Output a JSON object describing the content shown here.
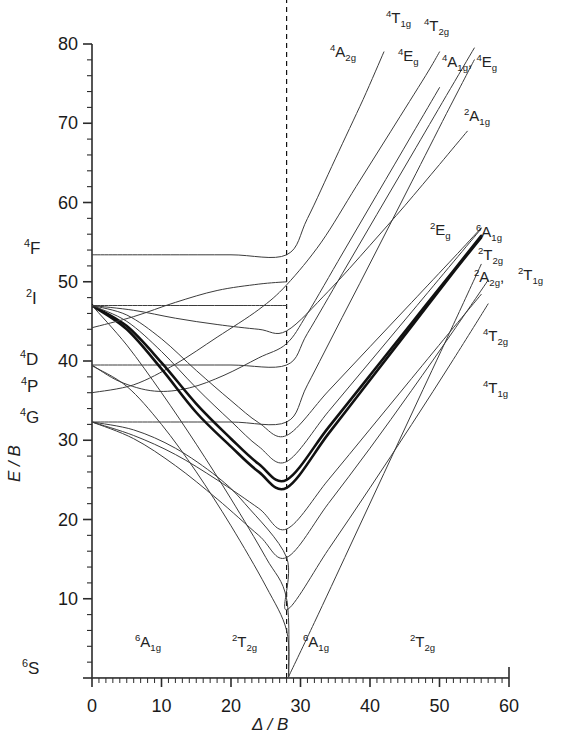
{
  "chart_data": {
    "type": "line",
    "title": "",
    "xlabel": "Δ / B",
    "ylabel": "E / B",
    "xlim": [
      0,
      60
    ],
    "ylim": [
      0,
      80
    ],
    "xticks": [
      0,
      10,
      20,
      30,
      40,
      50,
      60
    ],
    "yticks": [
      0,
      10,
      20,
      30,
      40,
      50,
      60,
      70,
      80
    ],
    "minor_tick_step": 2,
    "grid": false,
    "legend": "none",
    "crossover_x": 28,
    "crossover_line": "dashed vertical",
    "free_ion_terms": [
      {
        "label": "4F",
        "energy": 53.4
      },
      {
        "label": "2I",
        "energy": 47.0
      },
      {
        "label": "4D",
        "energy": 39.5
      },
      {
        "label": "4P",
        "energy": 36.0
      },
      {
        "label": "4G",
        "energy": 32.3
      },
      {
        "label": "6S",
        "energy": 0.0
      }
    ],
    "ground_state_labels": [
      {
        "label": "6A1g",
        "x": 9
      },
      {
        "label": "2T2g",
        "x": 24
      },
      {
        "label": "6A1g",
        "x": 32
      },
      {
        "label": "2T2g",
        "x": 48
      }
    ],
    "series": [
      {
        "name": "6A1g",
        "points": [
          [
            0,
            0
          ],
          [
            28,
            0
          ],
          [
            60,
            0
          ]
        ]
      },
      {
        "name": "4T1g_G",
        "points": [
          [
            0,
            32.3
          ],
          [
            6,
            30.2
          ],
          [
            12,
            26.8
          ],
          [
            18,
            22.6
          ],
          [
            24,
            18.0
          ],
          [
            28,
            15.2
          ],
          [
            34,
            22.0
          ],
          [
            40,
            29.0
          ],
          [
            46,
            36.3
          ],
          [
            52,
            43.8
          ],
          [
            57,
            50.2
          ]
        ]
      },
      {
        "name": "4T2g_G",
        "points": [
          [
            0,
            32.3
          ],
          [
            6,
            31.3
          ],
          [
            12,
            29.0
          ],
          [
            18,
            25.4
          ],
          [
            22,
            22.0
          ],
          [
            28,
            15.2
          ],
          [
            28,
            8.6
          ],
          [
            34,
            16.2
          ],
          [
            40,
            24.0
          ],
          [
            46,
            32.0
          ],
          [
            52,
            40.2
          ],
          [
            57,
            47.2
          ]
        ]
      },
      {
        "name": "4A1g4Eg_G",
        "points": [
          [
            0,
            32.3
          ],
          [
            10,
            32.3
          ],
          [
            20,
            32.3
          ],
          [
            28,
            32.3
          ],
          [
            31,
            37.0
          ],
          [
            36,
            45.5
          ],
          [
            41,
            54.0
          ],
          [
            46,
            62.6
          ],
          [
            51,
            71.2
          ],
          [
            55,
            78.0
          ]
        ]
      },
      {
        "name": "4T2g_D",
        "points": [
          [
            0,
            39.5
          ],
          [
            10,
            39.5
          ],
          [
            20,
            39.5
          ],
          [
            28,
            39.5
          ],
          [
            31,
            43.5
          ],
          [
            36,
            51.0
          ],
          [
            41,
            58.5
          ],
          [
            46,
            66.0
          ],
          [
            51,
            73.5
          ],
          [
            55,
            79.5
          ]
        ]
      },
      {
        "name": "4Eg_D",
        "points": [
          [
            0,
            39.5
          ],
          [
            4,
            37.4
          ],
          [
            9,
            36.2
          ],
          [
            14,
            36.6
          ],
          [
            19,
            38.2
          ],
          [
            24,
            40.4
          ],
          [
            28,
            42.2
          ],
          [
            31,
            46.0
          ],
          [
            36,
            53.5
          ],
          [
            41,
            61.0
          ],
          [
            46,
            68.5
          ],
          [
            50,
            74.5
          ]
        ]
      },
      {
        "name": "4A2g_F",
        "points": [
          [
            0,
            53.4
          ],
          [
            10,
            53.4
          ],
          [
            20,
            53.4
          ],
          [
            28,
            53.4
          ],
          [
            31,
            58.0
          ],
          [
            35,
            65.5
          ],
          [
            39,
            73.0
          ],
          [
            42,
            79.0
          ]
        ]
      },
      {
        "name": "4T1g_P",
        "points": [
          [
            0,
            36.0
          ],
          [
            6,
            37.0
          ],
          [
            12,
            39.6
          ],
          [
            18,
            43.0
          ],
          [
            24,
            46.5
          ],
          [
            28,
            49.6
          ],
          [
            33,
            55.0
          ],
          [
            38,
            62.0
          ],
          [
            43,
            69.0
          ],
          [
            48,
            76.0
          ],
          [
            50,
            79.0
          ]
        ]
      },
      {
        "name": "2T2g_I",
        "points": [
          [
            0,
            47.0
          ],
          [
            5,
            44.0
          ],
          [
            10,
            39.0
          ],
          [
            15,
            33.5
          ],
          [
            20,
            29.2
          ],
          [
            24,
            26.0
          ],
          [
            28,
            24.0
          ],
          [
            34,
            30.8
          ],
          [
            40,
            37.6
          ],
          [
            46,
            44.4
          ],
          [
            52,
            51.2
          ],
          [
            56,
            55.6
          ]
        ]
      },
      {
        "name": "2A2g_I",
        "points": [
          [
            0,
            47.0
          ],
          [
            5,
            44.4
          ],
          [
            10,
            39.8
          ],
          [
            15,
            34.6
          ],
          [
            20,
            30.2
          ],
          [
            24,
            27.0
          ],
          [
            28,
            25.0
          ],
          [
            34,
            31.6
          ],
          [
            40,
            38.2
          ],
          [
            46,
            44.8
          ],
          [
            52,
            51.4
          ],
          [
            56,
            55.8
          ]
        ]
      },
      {
        "name": "2T1g_I",
        "points": [
          [
            0,
            47.0
          ],
          [
            5,
            45.0
          ],
          [
            10,
            41.2
          ],
          [
            15,
            36.6
          ],
          [
            20,
            32.4
          ],
          [
            24,
            29.2
          ],
          [
            28,
            27.3
          ],
          [
            34,
            33.6
          ],
          [
            40,
            39.9
          ],
          [
            46,
            46.2
          ],
          [
            52,
            52.5
          ],
          [
            56,
            56.7
          ]
        ]
      },
      {
        "name": "2Eg_I",
        "points": [
          [
            0,
            47.0
          ],
          [
            5,
            45.8
          ],
          [
            10,
            42.8
          ],
          [
            15,
            38.8
          ],
          [
            20,
            35.0
          ],
          [
            24,
            32.2
          ],
          [
            28,
            30.6
          ],
          [
            34,
            36.2
          ],
          [
            40,
            41.8
          ],
          [
            46,
            47.4
          ],
          [
            52,
            53.0
          ],
          [
            56,
            56.8
          ]
        ]
      },
      {
        "name": "2A1g_I",
        "points": [
          [
            0,
            47.0
          ],
          [
            6,
            46.4
          ],
          [
            12,
            45.4
          ],
          [
            18,
            44.6
          ],
          [
            24,
            44.0
          ],
          [
            28,
            43.8
          ],
          [
            34,
            48.8
          ],
          [
            40,
            54.6
          ],
          [
            45,
            59.6
          ],
          [
            50,
            64.8
          ],
          [
            54,
            69.0
          ]
        ]
      },
      {
        "name": "2Eg_2",
        "points": [
          [
            0,
            32.3
          ],
          [
            6,
            30.6
          ],
          [
            12,
            28.2
          ],
          [
            18,
            25.0
          ],
          [
            24,
            21.4
          ],
          [
            28,
            18.8
          ],
          [
            34,
            25.0
          ],
          [
            40,
            31.4
          ],
          [
            46,
            37.8
          ],
          [
            52,
            44.2
          ],
          [
            56,
            48.4
          ]
        ]
      },
      {
        "name": "2I_flat",
        "points": [
          [
            0,
            47.0
          ],
          [
            10,
            47.0
          ],
          [
            20,
            47.0
          ],
          [
            28,
            47.0
          ]
        ]
      },
      {
        "name": "2T_rise",
        "points": [
          [
            0,
            44.2
          ],
          [
            6,
            45.6
          ],
          [
            12,
            47.4
          ],
          [
            18,
            48.9
          ],
          [
            24,
            49.7
          ],
          [
            28,
            50.0
          ]
        ]
      },
      {
        "name": "4T1g_low2",
        "points": [
          [
            0,
            47.0
          ],
          [
            5,
            42.0
          ],
          [
            10,
            36.0
          ],
          [
            15,
            29.5
          ],
          [
            20,
            22.6
          ],
          [
            25,
            15.2
          ],
          [
            28,
            10.0
          ],
          [
            28.3,
            0.2
          ]
        ]
      },
      {
        "name": "6A1g_rise",
        "points": [
          [
            28.3,
            0.2
          ],
          [
            32,
            7.0
          ],
          [
            37,
            16.4
          ],
          [
            42,
            25.8
          ],
          [
            47,
            35.2
          ],
          [
            52,
            44.6
          ],
          [
            56,
            52.2
          ]
        ]
      },
      {
        "name": "2T2g_descend",
        "points": [
          [
            0,
            39.4
          ],
          [
            5,
            36.8
          ],
          [
            10,
            32.0
          ],
          [
            15,
            26.0
          ],
          [
            20,
            19.2
          ],
          [
            25,
            11.6
          ],
          [
            28,
            6.0
          ],
          [
            28.3,
            0.2
          ]
        ]
      }
    ],
    "curve_labels": [
      {
        "label": "4A2g",
        "x": 340,
        "y": 48
      },
      {
        "label": "4T1g",
        "x": 395,
        "y": 14
      },
      {
        "label": "4Eg",
        "x": 402,
        "y": 52
      },
      {
        "label": "4T2g",
        "x": 428,
        "y": 22
      },
      {
        "label": "4A1g_4Eg",
        "x": 446,
        "y": 58
      },
      {
        "label": "2A1g",
        "x": 470,
        "y": 113
      },
      {
        "label": "2Eg",
        "x": 438,
        "y": 227
      },
      {
        "label": "6A1g",
        "x": 480,
        "y": 230
      },
      {
        "label": "2T2g",
        "x": 483,
        "y": 252
      },
      {
        "label": "2A2g",
        "x": 478,
        "y": 275
      },
      {
        "label": "2T1g",
        "x": 523,
        "y": 272
      },
      {
        "label": "4T2g",
        "x": 487,
        "y": 333
      },
      {
        "label": "4T1g",
        "x": 487,
        "y": 385
      }
    ]
  },
  "axes": {
    "y_title": "E / B",
    "x_title": "Δ / B",
    "x_tick_labels": [
      "0",
      "10",
      "20",
      "30",
      "40",
      "50",
      "60"
    ],
    "y_tick_labels": [
      "80",
      "70",
      "60",
      "50",
      "40",
      "30",
      "20",
      "10"
    ]
  },
  "terms": {
    "F4": "4F",
    "I2": "2I",
    "D4": "4D",
    "P4": "4P",
    "G4": "4G",
    "S6": "6S"
  },
  "colors": {
    "background": "#ffffff",
    "line": "#3c3c3c",
    "bold_line": "#111111",
    "axis": "#2b2b2b",
    "text": "#1a1a1a"
  }
}
